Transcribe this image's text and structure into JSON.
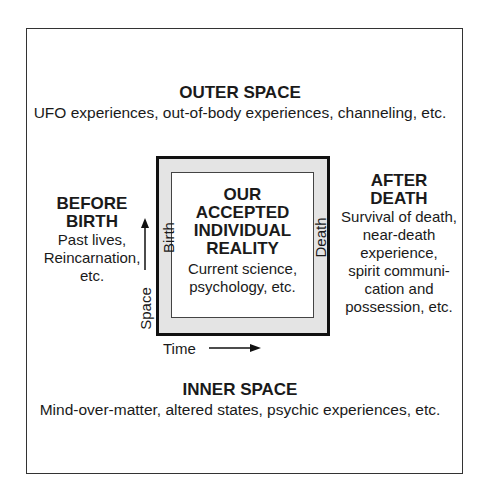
{
  "outer_space": {
    "title": "OUTER SPACE",
    "desc": "UFO experiences, out-of-body experiences, channeling, etc."
  },
  "center": {
    "title_lines": [
      "OUR",
      "ACCEPTED",
      "INDIVIDUAL",
      "REALITY"
    ],
    "desc_lines": [
      "Current science,",
      "psychology, etc."
    ]
  },
  "before_birth": {
    "title_lines": [
      "BEFORE",
      "BIRTH"
    ],
    "desc_lines": [
      "Past lives,",
      "Reincarnation,",
      "etc."
    ]
  },
  "after_death": {
    "title_lines": [
      "AFTER",
      "DEATH"
    ],
    "desc_lines": [
      "Survival of death,",
      "near-death",
      "experience,",
      "spirit communi-",
      "cation and",
      "possession, etc."
    ]
  },
  "inner_space": {
    "title": "INNER SPACE",
    "desc": "Mind-over-matter, altered states, psychic experiences, etc."
  },
  "axes": {
    "birth_label": "Birth",
    "death_label": "Death",
    "space_label": "Space",
    "time_label": "Time"
  }
}
